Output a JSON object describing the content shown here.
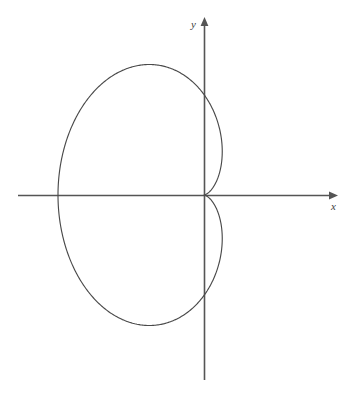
{
  "figure": {
    "title": "",
    "background_color": "#ffffff",
    "axis_color": "#555555",
    "curve_color": "#4a4a4a",
    "x_axis_label": "x",
    "y_axis_label": "y",
    "x_axis_label_name": "x-axis-label",
    "y_axis_label_name": "y-axis-label",
    "corner_mark": ""
  },
  "chart_data": {
    "type": "line",
    "plot_kind": "polar-curve-cardioid",
    "title": "",
    "subtitle": "",
    "xlabel": "x",
    "ylabel": "y",
    "legend": [],
    "legend_position": "none",
    "grid": false,
    "ticks": {
      "x": [],
      "y": []
    },
    "tick_labels": {
      "x": [],
      "y": []
    },
    "equation_polar": "r = a(1 - cos(theta))",
    "equation_note": "cardioid with cusp on the positive x-axis, opening toward negative x",
    "parameters": {
      "a": 73
    },
    "axis_ranges_pixels": {
      "origin": [
        204,
        195
      ],
      "x_axis_from": 18,
      "x_axis_to": 338,
      "y_axis_from": 380,
      "y_axis_to": 17
    },
    "key_points": {
      "cusp": {
        "label": "cusp",
        "x_pixel": 253,
        "y_pixel": 195,
        "theta_deg": 0,
        "r": 0
      },
      "leftmost": {
        "label": "leftmost extent",
        "x_pixel": 58,
        "y_pixel": 195,
        "theta_deg": 180,
        "r": 146
      },
      "topmost": {
        "label": "topmost extent",
        "x_pixel": 193,
        "y_pixel": 66
      },
      "bottommost": {
        "label": "bottommost extent",
        "x_pixel": 193,
        "y_pixel": 327
      },
      "rightmost_upper_lobe": {
        "label": "rightmost extent upper lobe",
        "x_pixel": 280,
        "y_pixel": 135
      },
      "rightmost_lower_lobe": {
        "label": "rightmost extent lower lobe",
        "x_pixel": 280,
        "y_pixel": 260
      }
    },
    "theta_samples_deg": [
      0,
      15,
      30,
      45,
      60,
      75,
      90,
      105,
      120,
      135,
      150,
      165,
      180,
      195,
      210,
      225,
      240,
      255,
      270,
      285,
      300,
      315,
      330,
      345,
      360
    ],
    "r_values": [
      0.0,
      2.49,
      9.78,
      21.38,
      36.5,
      54.11,
      73.0,
      91.89,
      109.5,
      124.62,
      136.22,
      143.51,
      146.0,
      143.51,
      136.22,
      124.62,
      109.5,
      91.89,
      73.0,
      54.11,
      36.5,
      21.38,
      9.78,
      2.49,
      0.0
    ],
    "x": [
      0.0,
      2.4,
      8.47,
      15.12,
      18.25,
      14.0,
      0.0,
      -23.78,
      -54.75,
      -88.12,
      -117.97,
      -138.58,
      -146.0,
      -138.58,
      -117.97,
      -88.12,
      -54.75,
      -23.78,
      0.0,
      14.0,
      18.25,
      15.12,
      8.47,
      2.4,
      0.0
    ],
    "y": [
      0.0,
      0.64,
      4.89,
      15.12,
      31.61,
      52.27,
      73.0,
      88.77,
      94.83,
      88.12,
      68.11,
      37.14,
      0.0,
      -37.14,
      -68.11,
      -88.12,
      -94.83,
      -88.77,
      -73.0,
      -52.27,
      -31.61,
      -15.12,
      -4.89,
      -0.64,
      0.0
    ]
  }
}
